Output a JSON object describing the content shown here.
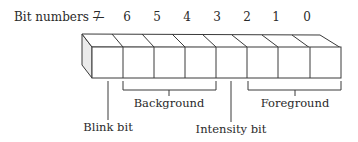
{
  "diagram": {
    "bit_numbers_label": "Bit numbers —",
    "bits": [
      "7",
      "6",
      "5",
      "4",
      "3",
      "2",
      "1",
      "0"
    ],
    "labels": {
      "blink": "Blink bit",
      "background": "Background",
      "intensity": "Intensity bit",
      "foreground": "Foreground"
    },
    "colors": {
      "stroke": "#3a3a3a",
      "side_face": "#ebebeb",
      "text": "#2a2a2a"
    }
  }
}
